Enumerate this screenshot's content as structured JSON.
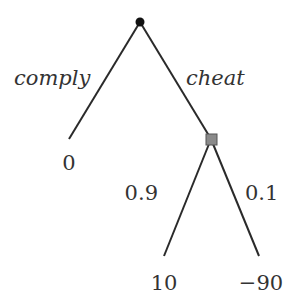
{
  "tree": {
    "root": {
      "type": "decision-node"
    },
    "branches": [
      {
        "label": "comply",
        "payoff": "0"
      },
      {
        "label": "cheat",
        "chance_node": {
          "outcomes": [
            {
              "probability": "0.9",
              "payoff": "10"
            },
            {
              "probability": "0.1",
              "payoff": "−90"
            }
          ]
        }
      }
    ]
  }
}
